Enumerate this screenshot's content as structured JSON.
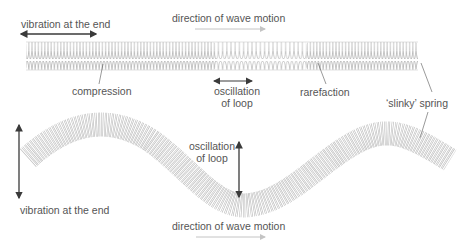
{
  "diagram": {
    "top_panel": {
      "title": "Longitudinal wave on a slinky spring",
      "labels": {
        "vibration": "vibration at the end",
        "direction": "direction of wave motion",
        "compression": "compression",
        "oscillation_line1": "oscillation",
        "oscillation_line2": "of loop",
        "rarefaction": "rarefaction",
        "spring": "‘slinky’ spring"
      }
    },
    "bottom_panel": {
      "title": "Transverse wave on a slinky spring",
      "labels": {
        "oscillation_line1": "oscillation",
        "oscillation_line2": "of loop",
        "vibration": "vibration at the end",
        "direction": "direction of wave motion"
      }
    },
    "colors": {
      "arrow_dark": "#3a3a3a",
      "arrow_light": "#c4c4c4",
      "coil": "#9a9a9a",
      "text": "#555555"
    }
  }
}
